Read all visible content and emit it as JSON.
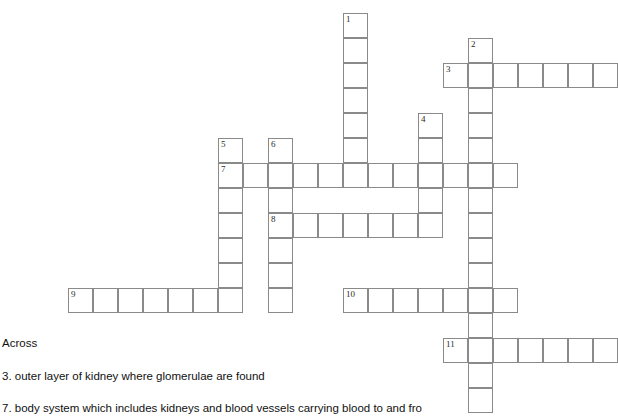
{
  "puzzle": {
    "title": "Kidney / urinary system crossword",
    "cell_size": 25,
    "grid_origin": {
      "x": 68,
      "y": 13
    },
    "entries": [
      {
        "number": "1",
        "direction": "down",
        "col": 11,
        "row": 0,
        "length": 7
      },
      {
        "number": "2",
        "direction": "down",
        "col": 16,
        "row": 1,
        "length": 15
      },
      {
        "number": "3",
        "direction": "across",
        "col": 15,
        "row": 2,
        "length": 7
      },
      {
        "number": "4",
        "direction": "down",
        "col": 14,
        "row": 4,
        "length": 5
      },
      {
        "number": "5",
        "direction": "down",
        "col": 6,
        "row": 5,
        "length": 7
      },
      {
        "number": "6",
        "direction": "down",
        "col": 8,
        "row": 5,
        "length": 7
      },
      {
        "number": "7",
        "direction": "across",
        "col": 6,
        "row": 6,
        "length": 12
      },
      {
        "number": "8",
        "direction": "across",
        "col": 8,
        "row": 8,
        "length": 6
      },
      {
        "number": "9",
        "direction": "across",
        "col": 0,
        "row": 11,
        "length": 7
      },
      {
        "number": "10",
        "direction": "across",
        "col": 11,
        "row": 11,
        "length": 7
      },
      {
        "number": "11",
        "direction": "across",
        "col": 15,
        "row": 13,
        "length": 7
      }
    ]
  },
  "clues": {
    "heading_across": "Across",
    "items": [
      "3. outer layer of kidney where glomerulae are found",
      "7. body system which includes kidneys and blood vessels carrying blood to and fro"
    ]
  },
  "colors": {
    "cell_border": "#8a8a8a",
    "cell_fill": "#ffffff",
    "text": "#111111",
    "number_text": "#2b2b2b",
    "page_background": "#ffffff"
  }
}
